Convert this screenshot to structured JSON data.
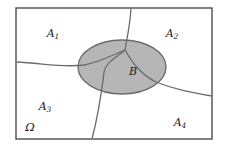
{
  "figure": {
    "kind": "set-partition-venn-diagram",
    "universe_label": "Ω",
    "event_label": "B",
    "partition_labels": [
      "A",
      "A",
      "A",
      "A"
    ],
    "partition_subscripts": [
      "1",
      "2",
      "3",
      "4"
    ],
    "labels": {
      "a1": "A",
      "a1_sub": "1",
      "a2": "A",
      "a2_sub": "2",
      "a3": "A",
      "a3_sub": "3",
      "a4": "A",
      "a4_sub": "4",
      "b": "B",
      "omega": "Ω"
    },
    "colors": {
      "frame_stroke": "#4d4d4d",
      "curve_stroke": "#6b6b6b",
      "ellipse_fill": "#b2b2b2",
      "ellipse_stroke": "#6b6b6b",
      "background": "#ffffff",
      "text": "#1a1a1a"
    },
    "geometry": {
      "frame": {
        "x": 16,
        "y": 8,
        "width": 196,
        "height": 131
      },
      "ellipse": {
        "cx": 122,
        "cy": 67,
        "rx": 44,
        "ry": 27
      },
      "junction": {
        "x": 125,
        "y": 50
      },
      "label_positions": {
        "a1": {
          "x": 53,
          "y": 37
        },
        "a2": {
          "x": 172,
          "y": 37
        },
        "a3": {
          "x": 45,
          "y": 110
        },
        "a4": {
          "x": 180,
          "y": 126
        },
        "b": {
          "x": 133,
          "y": 74
        },
        "omega": {
          "x": 30,
          "y": 130
        }
      }
    }
  }
}
